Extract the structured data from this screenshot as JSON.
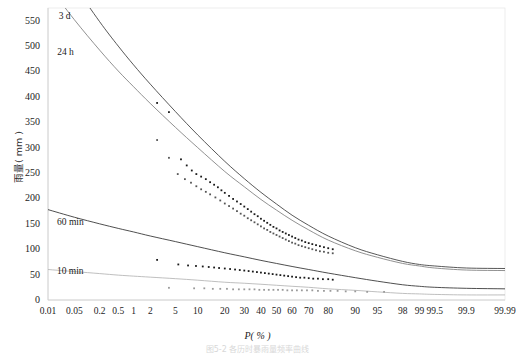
{
  "figure": {
    "caption": "图5-2 各历时暴雨量频率曲线"
  },
  "chart_data": {
    "type": "line",
    "title": "",
    "xlabel": "P( % )",
    "ylabel": "雨量( mm )",
    "x_scale": "normal-probability",
    "grid": false,
    "legend": "inline-curve-labels",
    "ylim": [
      0,
      575
    ],
    "yticks": [
      0,
      50,
      100,
      150,
      200,
      250,
      300,
      350,
      400,
      450,
      500,
      550
    ],
    "xticks": [
      0.01,
      0.05,
      0.2,
      0.5,
      1,
      2,
      5,
      10,
      20,
      30,
      40,
      50,
      60,
      70,
      80,
      90,
      95,
      98,
      99,
      99.5,
      99.9,
      99.99
    ],
    "xtick_labels": [
      "0.01",
      "0.05",
      "0.2",
      "0.5",
      "1",
      "2",
      "5",
      "10",
      "20",
      "30",
      "40",
      "50",
      "60",
      "70",
      "80",
      "90",
      "95",
      "98",
      "99",
      "99.5",
      "99.9",
      "99.99"
    ],
    "series": [
      {
        "name": "3 d",
        "label": "3 d",
        "color": "#3a3a3a",
        "point_color": "#1a1a1a",
        "label_x_pct": 0.6,
        "label_y": 558,
        "curve": [
          {
            "p": 0.01,
            "v": 700
          },
          {
            "p": 0.05,
            "v": 620
          },
          {
            "p": 0.2,
            "v": 548
          },
          {
            "p": 0.5,
            "v": 500
          },
          {
            "p": 1,
            "v": 463
          },
          {
            "p": 2,
            "v": 425
          },
          {
            "p": 5,
            "v": 371
          },
          {
            "p": 10,
            "v": 325
          },
          {
            "p": 20,
            "v": 273
          },
          {
            "p": 30,
            "v": 239
          },
          {
            "p": 40,
            "v": 212
          },
          {
            "p": 50,
            "v": 189
          },
          {
            "p": 60,
            "v": 167
          },
          {
            "p": 70,
            "v": 147
          },
          {
            "p": 80,
            "v": 126
          },
          {
            "p": 90,
            "v": 103
          },
          {
            "p": 95,
            "v": 89
          },
          {
            "p": 98,
            "v": 76
          },
          {
            "p": 99,
            "v": 70
          },
          {
            "p": 99.5,
            "v": 67
          },
          {
            "p": 99.9,
            "v": 63
          },
          {
            "p": 99.99,
            "v": 62
          }
        ],
        "points": [
          {
            "p": 2.6,
            "v": 388
          },
          {
            "p": 4.0,
            "v": 370
          },
          {
            "p": 6.0,
            "v": 277
          },
          {
            "p": 7.2,
            "v": 265
          },
          {
            "p": 8.4,
            "v": 255
          },
          {
            "p": 9.6,
            "v": 248
          },
          {
            "p": 11.0,
            "v": 243
          },
          {
            "p": 12.5,
            "v": 238
          },
          {
            "p": 14.0,
            "v": 232
          },
          {
            "p": 15.5,
            "v": 227
          },
          {
            "p": 17.0,
            "v": 222
          },
          {
            "p": 18.5,
            "v": 216
          },
          {
            "p": 20.0,
            "v": 211
          },
          {
            "p": 22.0,
            "v": 205
          },
          {
            "p": 24.0,
            "v": 199
          },
          {
            "p": 26.0,
            "v": 194
          },
          {
            "p": 28.0,
            "v": 189
          },
          {
            "p": 30.0,
            "v": 184
          },
          {
            "p": 32.0,
            "v": 179
          },
          {
            "p": 34.0,
            "v": 174
          },
          {
            "p": 36.0,
            "v": 169
          },
          {
            "p": 38.0,
            "v": 165
          },
          {
            "p": 40.0,
            "v": 160
          },
          {
            "p": 42.0,
            "v": 156
          },
          {
            "p": 44.0,
            "v": 152
          },
          {
            "p": 46.0,
            "v": 148
          },
          {
            "p": 48.0,
            "v": 144
          },
          {
            "p": 50.0,
            "v": 141
          },
          {
            "p": 52.0,
            "v": 137
          },
          {
            "p": 54.0,
            "v": 134
          },
          {
            "p": 56.0,
            "v": 131
          },
          {
            "p": 58.0,
            "v": 128
          },
          {
            "p": 60.0,
            "v": 125
          },
          {
            "p": 62.0,
            "v": 122
          },
          {
            "p": 64.0,
            "v": 119
          },
          {
            "p": 66.0,
            "v": 117
          },
          {
            "p": 68.0,
            "v": 114
          },
          {
            "p": 70.0,
            "v": 112
          },
          {
            "p": 72.0,
            "v": 110
          },
          {
            "p": 74.0,
            "v": 108
          },
          {
            "p": 76.0,
            "v": 106
          },
          {
            "p": 78.0,
            "v": 104
          },
          {
            "p": 80.0,
            "v": 102
          },
          {
            "p": 82.0,
            "v": 100
          }
        ]
      },
      {
        "name": "24 h",
        "label": "24 h",
        "color": "#7d7d7d",
        "point_color": "#555555",
        "label_x_pct": 0.25,
        "label_y": 487,
        "curve": [
          {
            "p": 0.01,
            "v": 620
          },
          {
            "p": 0.05,
            "v": 552
          },
          {
            "p": 0.2,
            "v": 492
          },
          {
            "p": 0.5,
            "v": 451
          },
          {
            "p": 1,
            "v": 420
          },
          {
            "p": 2,
            "v": 387
          },
          {
            "p": 5,
            "v": 340
          },
          {
            "p": 10,
            "v": 300
          },
          {
            "p": 20,
            "v": 253
          },
          {
            "p": 30,
            "v": 223
          },
          {
            "p": 40,
            "v": 198
          },
          {
            "p": 50,
            "v": 177
          },
          {
            "p": 60,
            "v": 157
          },
          {
            "p": 70,
            "v": 138
          },
          {
            "p": 80,
            "v": 118
          },
          {
            "p": 90,
            "v": 97
          },
          {
            "p": 95,
            "v": 84
          },
          {
            "p": 98,
            "v": 72
          },
          {
            "p": 99,
            "v": 67
          },
          {
            "p": 99.5,
            "v": 63
          },
          {
            "p": 99.9,
            "v": 59
          },
          {
            "p": 99.99,
            "v": 58
          }
        ],
        "points": [
          {
            "p": 2.6,
            "v": 315
          },
          {
            "p": 4.0,
            "v": 280
          },
          {
            "p": 5.4,
            "v": 248
          },
          {
            "p": 6.8,
            "v": 238
          },
          {
            "p": 8.2,
            "v": 231
          },
          {
            "p": 9.6,
            "v": 224
          },
          {
            "p": 11.0,
            "v": 218
          },
          {
            "p": 12.5,
            "v": 213
          },
          {
            "p": 14.0,
            "v": 208
          },
          {
            "p": 16.0,
            "v": 202
          },
          {
            "p": 18.0,
            "v": 196
          },
          {
            "p": 20.0,
            "v": 190
          },
          {
            "p": 22.0,
            "v": 185
          },
          {
            "p": 24.0,
            "v": 180
          },
          {
            "p": 26.0,
            "v": 175
          },
          {
            "p": 28.0,
            "v": 170
          },
          {
            "p": 30.0,
            "v": 166
          },
          {
            "p": 32.0,
            "v": 161
          },
          {
            "p": 34.0,
            "v": 157
          },
          {
            "p": 36.0,
            "v": 153
          },
          {
            "p": 38.0,
            "v": 149
          },
          {
            "p": 40.0,
            "v": 145
          },
          {
            "p": 42.0,
            "v": 141
          },
          {
            "p": 44.0,
            "v": 138
          },
          {
            "p": 46.0,
            "v": 134
          },
          {
            "p": 48.0,
            "v": 131
          },
          {
            "p": 50.0,
            "v": 128
          },
          {
            "p": 52.0,
            "v": 125
          },
          {
            "p": 54.0,
            "v": 122
          },
          {
            "p": 56.0,
            "v": 119
          },
          {
            "p": 58.0,
            "v": 116
          },
          {
            "p": 60.0,
            "v": 113
          },
          {
            "p": 62.0,
            "v": 111
          },
          {
            "p": 64.0,
            "v": 108
          },
          {
            "p": 66.0,
            "v": 106
          },
          {
            "p": 68.0,
            "v": 104
          },
          {
            "p": 70.0,
            "v": 102
          },
          {
            "p": 72.0,
            "v": 100
          },
          {
            "p": 74.0,
            "v": 98
          },
          {
            "p": 76.0,
            "v": 96
          },
          {
            "p": 78.0,
            "v": 95
          },
          {
            "p": 80.0,
            "v": 93
          },
          {
            "p": 82.0,
            "v": 92
          }
        ]
      },
      {
        "name": "60 min",
        "label": "60 min",
        "color": "#2f2f2f",
        "point_color": "#1a1a1a",
        "label_x_pct": 0.22,
        "label_y": 152,
        "curve": [
          {
            "p": 0.01,
            "v": 178
          },
          {
            "p": 0.05,
            "v": 163
          },
          {
            "p": 0.2,
            "v": 150
          },
          {
            "p": 0.5,
            "v": 141
          },
          {
            "p": 1,
            "v": 134
          },
          {
            "p": 2,
            "v": 126
          },
          {
            "p": 5,
            "v": 115
          },
          {
            "p": 10,
            "v": 105
          },
          {
            "p": 20,
            "v": 93
          },
          {
            "p": 30,
            "v": 85
          },
          {
            "p": 40,
            "v": 78
          },
          {
            "p": 50,
            "v": 72
          },
          {
            "p": 60,
            "v": 66
          },
          {
            "p": 70,
            "v": 60
          },
          {
            "p": 80,
            "v": 53
          },
          {
            "p": 90,
            "v": 44
          },
          {
            "p": 95,
            "v": 37
          },
          {
            "p": 98,
            "v": 30
          },
          {
            "p": 99,
            "v": 27
          },
          {
            "p": 99.5,
            "v": 25
          },
          {
            "p": 99.9,
            "v": 23
          },
          {
            "p": 99.99,
            "v": 22
          }
        ],
        "points": [
          {
            "p": 2.6,
            "v": 79
          },
          {
            "p": 5.5,
            "v": 70
          },
          {
            "p": 7.5,
            "v": 68
          },
          {
            "p": 9.5,
            "v": 67
          },
          {
            "p": 11.5,
            "v": 66
          },
          {
            "p": 13.5,
            "v": 65
          },
          {
            "p": 15.5,
            "v": 64
          },
          {
            "p": 17.5,
            "v": 63
          },
          {
            "p": 20.0,
            "v": 62
          },
          {
            "p": 22.5,
            "v": 61
          },
          {
            "p": 25.0,
            "v": 60
          },
          {
            "p": 27.5,
            "v": 59
          },
          {
            "p": 30.0,
            "v": 58
          },
          {
            "p": 32.5,
            "v": 57
          },
          {
            "p": 35.0,
            "v": 56
          },
          {
            "p": 37.5,
            "v": 55
          },
          {
            "p": 40.0,
            "v": 54
          },
          {
            "p": 42.5,
            "v": 53
          },
          {
            "p": 45.0,
            "v": 52
          },
          {
            "p": 47.5,
            "v": 51
          },
          {
            "p": 50.0,
            "v": 50
          },
          {
            "p": 52.5,
            "v": 49
          },
          {
            "p": 55.0,
            "v": 48
          },
          {
            "p": 57.5,
            "v": 47
          },
          {
            "p": 60.0,
            "v": 46
          },
          {
            "p": 62.5,
            "v": 45
          },
          {
            "p": 65.0,
            "v": 44
          },
          {
            "p": 67.5,
            "v": 44
          },
          {
            "p": 70.0,
            "v": 43
          },
          {
            "p": 72.5,
            "v": 42
          },
          {
            "p": 75.0,
            "v": 42
          },
          {
            "p": 77.5,
            "v": 41
          },
          {
            "p": 80.0,
            "v": 41
          },
          {
            "p": 82.0,
            "v": 40
          }
        ]
      },
      {
        "name": "10 min",
        "label": "10 min",
        "color": "#b4b4b4",
        "point_color": "#9a9a9a",
        "label_x_pct": 0.2,
        "label_y": 55,
        "curve": [
          {
            "p": 0.01,
            "v": 60
          },
          {
            "p": 0.05,
            "v": 56
          },
          {
            "p": 0.2,
            "v": 52
          },
          {
            "p": 0.5,
            "v": 49
          },
          {
            "p": 1,
            "v": 47
          },
          {
            "p": 2,
            "v": 45
          },
          {
            "p": 5,
            "v": 42
          },
          {
            "p": 10,
            "v": 39
          },
          {
            "p": 20,
            "v": 35
          },
          {
            "p": 30,
            "v": 33
          },
          {
            "p": 40,
            "v": 31
          },
          {
            "p": 50,
            "v": 29
          },
          {
            "p": 60,
            "v": 27
          },
          {
            "p": 70,
            "v": 25
          },
          {
            "p": 80,
            "v": 22
          },
          {
            "p": 90,
            "v": 19
          },
          {
            "p": 95,
            "v": 16
          },
          {
            "p": 98,
            "v": 13
          },
          {
            "p": 99,
            "v": 12
          },
          {
            "p": 99.5,
            "v": 11
          },
          {
            "p": 99.9,
            "v": 10
          },
          {
            "p": 99.99,
            "v": 10
          }
        ],
        "points": [
          {
            "p": 4.0,
            "v": 24
          },
          {
            "p": 9.0,
            "v": 23
          },
          {
            "p": 12.0,
            "v": 23
          },
          {
            "p": 15.0,
            "v": 22
          },
          {
            "p": 18.0,
            "v": 22
          },
          {
            "p": 21.0,
            "v": 22
          },
          {
            "p": 24.0,
            "v": 21
          },
          {
            "p": 27.0,
            "v": 21
          },
          {
            "p": 30.0,
            "v": 21
          },
          {
            "p": 33.0,
            "v": 21
          },
          {
            "p": 36.0,
            "v": 21
          },
          {
            "p": 39.0,
            "v": 20
          },
          {
            "p": 42.0,
            "v": 20
          },
          {
            "p": 45.0,
            "v": 20
          },
          {
            "p": 48.0,
            "v": 20
          },
          {
            "p": 51.0,
            "v": 20
          },
          {
            "p": 54.0,
            "v": 20
          },
          {
            "p": 57.0,
            "v": 19
          },
          {
            "p": 60.0,
            "v": 19
          },
          {
            "p": 63.0,
            "v": 19
          },
          {
            "p": 66.0,
            "v": 19
          },
          {
            "p": 69.0,
            "v": 19
          },
          {
            "p": 72.0,
            "v": 19
          },
          {
            "p": 75.0,
            "v": 18
          },
          {
            "p": 78.0,
            "v": 18
          },
          {
            "p": 81.0,
            "v": 18
          },
          {
            "p": 84.0,
            "v": 18
          },
          {
            "p": 87.0,
            "v": 17
          },
          {
            "p": 90.0,
            "v": 17
          },
          {
            "p": 93.0,
            "v": 16
          },
          {
            "p": 96.0,
            "v": 16
          }
        ]
      }
    ]
  }
}
